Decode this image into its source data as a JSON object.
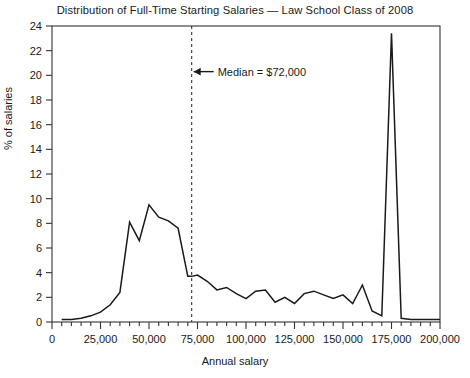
{
  "chart_data": {
    "type": "line",
    "title": "Distribution of Full-Time Starting Salaries — Law School Class of 2008",
    "xlabel": "Annual salary",
    "ylabel": "% of salaries",
    "xlim": [
      0,
      200000
    ],
    "ylim": [
      0,
      24
    ],
    "grid": false,
    "legend": null,
    "x_major_tick_step": 25000,
    "x_minor_tick_step": 5000,
    "y_major_tick_step": 2,
    "x_tick_labels": [
      "0",
      "25,000",
      "50,000",
      "75,000",
      "100,000",
      "125,000",
      "150,000",
      "175,000",
      "200,000"
    ],
    "y_tick_labels": [
      "0",
      "2",
      "4",
      "6",
      "8",
      "10",
      "12",
      "14",
      "16",
      "18",
      "20",
      "22",
      "24"
    ],
    "series": [
      {
        "name": "% of salaries",
        "color": "#1a1a1a",
        "x": [
          5000,
          10000,
          15000,
          20000,
          25000,
          30000,
          35000,
          40000,
          45000,
          50000,
          55000,
          60000,
          65000,
          70000,
          72000,
          75000,
          80000,
          85000,
          90000,
          95000,
          100000,
          105000,
          110000,
          115000,
          120000,
          125000,
          130000,
          135000,
          140000,
          145000,
          150000,
          155000,
          160000,
          165000,
          170000,
          175000,
          180000,
          185000,
          190000,
          195000,
          200000
        ],
        "values": [
          0.2,
          0.2,
          0.3,
          0.5,
          0.8,
          1.4,
          2.4,
          8.1,
          6.6,
          9.5,
          8.5,
          8.2,
          7.6,
          3.7,
          3.7,
          3.8,
          3.3,
          2.6,
          2.8,
          2.3,
          1.9,
          2.5,
          2.6,
          1.6,
          2.0,
          1.5,
          2.3,
          2.5,
          2.2,
          1.9,
          2.2,
          1.5,
          3.0,
          0.9,
          0.5,
          23.4,
          0.3,
          0.2,
          0.2,
          0.2,
          0.2
        ]
      }
    ],
    "annotations": [
      {
        "name": "median-line",
        "type": "vline",
        "x": 72000,
        "style": "dashed",
        "label": "Median = $72,000",
        "label_x": 78000,
        "label_y": 20.3,
        "arrow": "left"
      }
    ]
  }
}
